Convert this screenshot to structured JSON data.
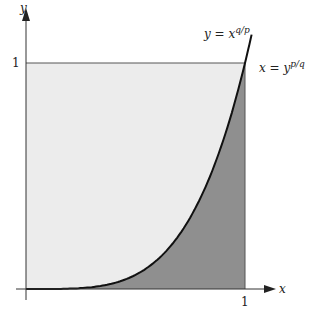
{
  "chart_data": {
    "type": "area",
    "title": "",
    "xlabel": "x",
    "ylabel": "y",
    "xlim": [
      0,
      1
    ],
    "ylim": [
      0,
      1
    ],
    "x_ticks": [
      "1"
    ],
    "y_ticks": [
      "1"
    ],
    "grid": false,
    "curve": {
      "label_top": "y = x^{q/p}",
      "label_right": "x = y^{p/q}",
      "approx_exponent": 4,
      "samples": [
        {
          "x": 0.0,
          "y": 0.0
        },
        {
          "x": 0.25,
          "y": 0.004
        },
        {
          "x": 0.5,
          "y": 0.0625
        },
        {
          "x": 0.565,
          "y": 0.1
        },
        {
          "x": 0.75,
          "y": 0.32
        },
        {
          "x": 0.79,
          "y": 0.48
        },
        {
          "x": 0.9,
          "y": 0.66
        },
        {
          "x": 1.0,
          "y": 1.0
        }
      ]
    },
    "regions": [
      {
        "name": "above-curve",
        "color": "#ececec"
      },
      {
        "name": "below-curve",
        "color": "#8f8f8f"
      }
    ]
  },
  "labels": {
    "x_axis": "x",
    "y_axis": "y",
    "x_tick_1": "1",
    "y_tick_1": "1",
    "curve_label_y": "y = x",
    "curve_label_y_exp": "q/p",
    "curve_label_x": "x = y",
    "curve_label_x_exp": "p/q"
  }
}
